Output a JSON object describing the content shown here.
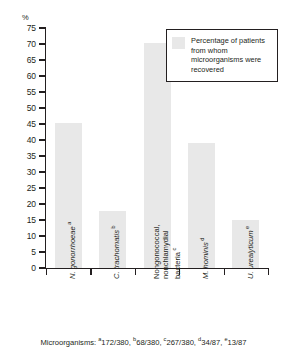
{
  "chart_data": {
    "type": "bar",
    "title": "",
    "xlabel": "Microorganisms",
    "ylabel": "%",
    "ylim": [
      0,
      75
    ],
    "yticks": [
      0,
      5,
      10,
      15,
      20,
      25,
      30,
      35,
      40,
      45,
      50,
      55,
      60,
      65,
      70,
      75
    ],
    "grid": false,
    "legend_position": "top-right",
    "categories": [
      "N. gonorrhoeae",
      "C. trachomatis",
      "Nongonococcal, nonchlamydial bacteria",
      "M. hominis",
      "U. urealyticum"
    ],
    "category_markers": [
      "a",
      "b",
      "c",
      "d",
      "e"
    ],
    "values": [
      45.3,
      17.9,
      70.3,
      39.1,
      14.9
    ],
    "series": [
      {
        "name": "Percentage of patients from whom microorganisms were recovered",
        "values": [
          45.3,
          17.9,
          70.3,
          39.1,
          14.9
        ]
      }
    ],
    "bar_color": "#e8e8e8"
  },
  "axis": {
    "y_unit_label": "%",
    "tick_labels": [
      "75",
      "70",
      "65",
      "60",
      "55",
      "50",
      "45",
      "40",
      "35",
      "30",
      "25",
      "20",
      "15",
      "10",
      "5",
      "0"
    ]
  },
  "legend": {
    "label": "Percentage of patients from whom microorganisms were recovered"
  },
  "x_labels": [
    {
      "name": "N. gonorrhoeae",
      "marker": "a",
      "lines": [
        "N. gonorrhoeae"
      ],
      "italic": true
    },
    {
      "name": "C. trachomatis",
      "marker": "b",
      "lines": [
        "C. trachomatis"
      ],
      "italic": true
    },
    {
      "name": "Nongonococcal, nonchlamydial bacteria",
      "marker": "c",
      "lines": [
        "Nongonococcal,",
        "nonchlamydial",
        "bacteria"
      ],
      "italic": false
    },
    {
      "name": "M. hominis",
      "marker": "d",
      "lines": [
        "M. hominis"
      ],
      "italic": true
    },
    {
      "name": "U. urealyticum",
      "marker": "e",
      "lines": [
        "U. urealyticum"
      ],
      "italic": true
    }
  ],
  "footnote": {
    "prefix": "Microorganisms:",
    "entries": [
      {
        "marker": "a",
        "value": "172/380,"
      },
      {
        "marker": "b",
        "value": "68/380,"
      },
      {
        "marker": "c",
        "value": "267/380,"
      },
      {
        "marker": "d",
        "value": "34/87,"
      },
      {
        "marker": "e",
        "value": "13/87"
      }
    ]
  }
}
